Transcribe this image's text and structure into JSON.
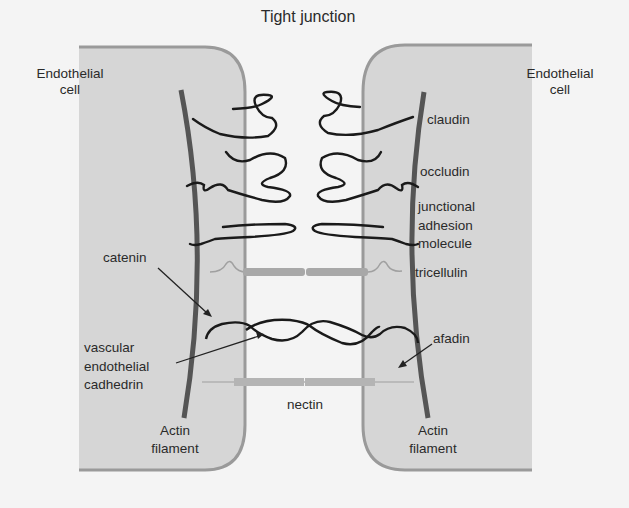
{
  "diagram": {
    "title": "Tight junction",
    "cells": {
      "left": {
        "label_line1": "Endothelial",
        "label_line2": "cell"
      },
      "right": {
        "label_line1": "Endothelial",
        "label_line2": "cell"
      }
    },
    "proteins": {
      "claudin": "claudin",
      "occludin": "occludin",
      "jam_line1": "junctional",
      "jam_line2": "adhesion",
      "jam_line3": "molecule",
      "tricellulin": "tricellulin",
      "catenin": "catenin",
      "afadin": "afadin",
      "ve_cad_line1": "vascular",
      "ve_cad_line2": "endothelial",
      "ve_cad_line3": "cadhedrin",
      "nectin": "nectin"
    },
    "actin": {
      "left": {
        "line1": "Actin",
        "line2": "filament"
      },
      "right": {
        "line1": "Actin",
        "line2": "filament"
      }
    },
    "colors": {
      "background": "#f4f4f4",
      "cell_fill": "#d6d6d6",
      "cell_border": "#9a9a9a",
      "actin": "#555555",
      "protein_strand": "#1a1a1a",
      "bar": "#a8a8a8"
    }
  }
}
